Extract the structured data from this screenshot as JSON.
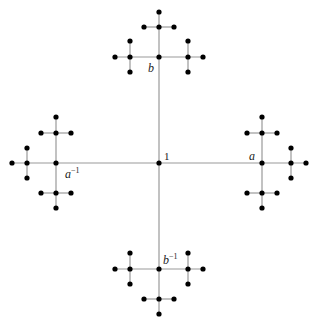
{
  "diagram": {
    "labels": {
      "identity": "1",
      "a": "a",
      "a_inv": "a",
      "a_inv_sup": "−1",
      "b": "b",
      "b_inv": "b",
      "b_inv_sup": "−1"
    },
    "colors": {
      "edge": "#999999",
      "node": "#000000"
    },
    "edges": [
      [
        56,
        163,
        262,
        163
      ],
      [
        159,
        57,
        159,
        269
      ],
      [
        115,
        57,
        203,
        57
      ],
      [
        130,
        41,
        130,
        72
      ],
      [
        188,
        41,
        188,
        72
      ],
      [
        159,
        57,
        159,
        12
      ],
      [
        144,
        27,
        174,
        27
      ],
      [
        115,
        269,
        203,
        269
      ],
      [
        130,
        253,
        130,
        284
      ],
      [
        188,
        253,
        188,
        284
      ],
      [
        159,
        269,
        159,
        314
      ],
      [
        144,
        299,
        174,
        299
      ],
      [
        56,
        117,
        56,
        208
      ],
      [
        41,
        133,
        71,
        133
      ],
      [
        41,
        193,
        71,
        193
      ],
      [
        56,
        163,
        12,
        163
      ],
      [
        27,
        148,
        27,
        178
      ],
      [
        262,
        117,
        262,
        208
      ],
      [
        247,
        133,
        277,
        133
      ],
      [
        247,
        193,
        277,
        193
      ],
      [
        262,
        163,
        306,
        163
      ],
      [
        291,
        148,
        291,
        178
      ]
    ],
    "nodes": [
      [
        159,
        163
      ],
      [
        159,
        57
      ],
      [
        130,
        57
      ],
      [
        115,
        57
      ],
      [
        188,
        57
      ],
      [
        203,
        57
      ],
      [
        130,
        41
      ],
      [
        130,
        72
      ],
      [
        188,
        41
      ],
      [
        188,
        72
      ],
      [
        159,
        27
      ],
      [
        159,
        12
      ],
      [
        144,
        27
      ],
      [
        174,
        27
      ],
      [
        159,
        269
      ],
      [
        130,
        269
      ],
      [
        115,
        269
      ],
      [
        188,
        269
      ],
      [
        203,
        269
      ],
      [
        130,
        253
      ],
      [
        130,
        284
      ],
      [
        188,
        253
      ],
      [
        188,
        284
      ],
      [
        159,
        299
      ],
      [
        159,
        314
      ],
      [
        144,
        299
      ],
      [
        174,
        299
      ],
      [
        56,
        163
      ],
      [
        56,
        133
      ],
      [
        56,
        117
      ],
      [
        56,
        193
      ],
      [
        56,
        208
      ],
      [
        41,
        133
      ],
      [
        71,
        133
      ],
      [
        41,
        193
      ],
      [
        71,
        193
      ],
      [
        27,
        163
      ],
      [
        12,
        163
      ],
      [
        27,
        148
      ],
      [
        27,
        178
      ],
      [
        262,
        163
      ],
      [
        262,
        133
      ],
      [
        262,
        117
      ],
      [
        262,
        193
      ],
      [
        262,
        208
      ],
      [
        247,
        133
      ],
      [
        277,
        133
      ],
      [
        247,
        193
      ],
      [
        277,
        193
      ],
      [
        291,
        163
      ],
      [
        306,
        163
      ],
      [
        291,
        148
      ],
      [
        291,
        178
      ]
    ]
  }
}
